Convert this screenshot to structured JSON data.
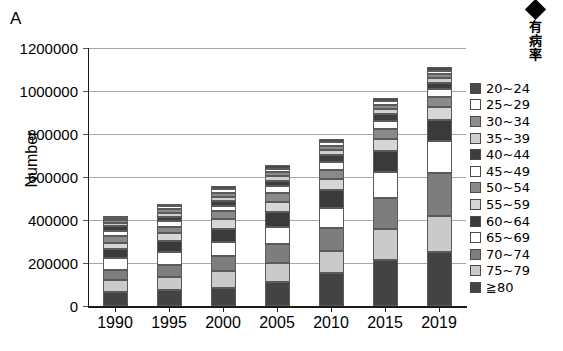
{
  "panel": {
    "letter": "A"
  },
  "prevalence_marker": {
    "icon": "black-diamond-marker",
    "label_chars": [
      "有",
      "病",
      "率"
    ],
    "label": "有病率"
  },
  "axes": {
    "ylabel": "Number",
    "xlabel": "",
    "ytick_labels": [
      "0",
      "200000",
      "400000",
      "600000",
      "800000",
      "1000000",
      "1200000"
    ],
    "ytick_values": [
      0,
      200000,
      400000,
      600000,
      800000,
      1000000,
      1200000
    ],
    "ylim": [
      0,
      1200000
    ],
    "grid": "horizontal",
    "grid_color": "#a8a8a8"
  },
  "legend": {
    "position": "right",
    "items": [
      {
        "label": "20~24",
        "color": "#4a4a4a"
      },
      {
        "label": "25~29",
        "color": "#ffffff"
      },
      {
        "label": "30~34",
        "color": "#8c8c8c"
      },
      {
        "label": "35~39",
        "color": "#cfcfcf"
      },
      {
        "label": "40~44",
        "color": "#3d3d3d"
      },
      {
        "label": "45~49",
        "color": "#fdfdfd"
      },
      {
        "label": "50~54",
        "color": "#8a8a8a"
      },
      {
        "label": "55~59",
        "color": "#d6d6d6"
      },
      {
        "label": "60~64",
        "color": "#3a3a3a"
      },
      {
        "label": "65~69",
        "color": "#ffffff"
      },
      {
        "label": "70~74",
        "color": "#7d7d7d"
      },
      {
        "label": "75~79",
        "color": "#cacaca"
      },
      {
        "label": "≧80",
        "color": "#434343"
      }
    ]
  },
  "chart_data": {
    "type": "bar",
    "subtype": "stacked-vertical",
    "title": "",
    "xlabel": "",
    "ylabel": "Number",
    "ylim": [
      0,
      1200000
    ],
    "categories": [
      "1990",
      "1995",
      "2000",
      "2005",
      "2010",
      "2015",
      "2019"
    ],
    "stack_order_bottom_to_top": [
      "≧80",
      "75~79",
      "70~74",
      "65~69",
      "60~64",
      "55~59",
      "50~54",
      "45~49",
      "40~44",
      "35~39",
      "30~34",
      "25~29",
      "20~24"
    ],
    "series": [
      {
        "name": "≧80",
        "color": "#434343",
        "values": [
          63000,
          74000,
          84000,
          110000,
          152000,
          215000,
          253000
        ]
      },
      {
        "name": "75~79",
        "color": "#cacaca",
        "values": [
          56000,
          62000,
          78000,
          92000,
          104000,
          145000,
          168000
        ]
      },
      {
        "name": "70~74",
        "color": "#7d7d7d",
        "values": [
          47000,
          55000,
          73000,
          85000,
          106000,
          143000,
          198000
        ]
      },
      {
        "name": "65~69",
        "color": "#ffffff",
        "values": [
          56000,
          59000,
          65000,
          82000,
          94000,
          120000,
          149000
        ]
      },
      {
        "name": "60~64",
        "color": "#3a3a3a",
        "values": [
          44000,
          54000,
          60000,
          68000,
          84000,
          99000,
          96000
        ]
      },
      {
        "name": "55~59",
        "color": "#d6d6d6",
        "values": [
          29000,
          35000,
          44000,
          47000,
          50000,
          56000,
          61000
        ]
      },
      {
        "name": "50~54",
        "color": "#8a8a8a",
        "values": [
          31000,
          29000,
          36000,
          42000,
          44000,
          45000,
          48000
        ]
      },
      {
        "name": "45~49",
        "color": "#fdfdfd",
        "values": [
          25000,
          26000,
          26000,
          32000,
          38000,
          37000,
          38000
        ]
      },
      {
        "name": "40~44",
        "color": "#3d3d3d",
        "values": [
          22000,
          22000,
          24000,
          26000,
          31000,
          32000,
          27000
        ]
      },
      {
        "name": "35~39",
        "color": "#cfcfcf",
        "values": [
          15000,
          18000,
          19000,
          21000,
          22000,
          25000,
          22000
        ]
      },
      {
        "name": "30~34",
        "color": "#8c8c8c",
        "values": [
          14000,
          16000,
          18000,
          18000,
          20000,
          20000,
          19000
        ]
      },
      {
        "name": "25~29",
        "color": "#ffffff",
        "values": [
          10000,
          14000,
          16000,
          17000,
          17000,
          16000,
          16000
        ]
      },
      {
        "name": "20~24",
        "color": "#4a4a4a",
        "values": [
          8000,
          12000,
          14000,
          15000,
          16000,
          15000,
          15000
        ]
      }
    ],
    "totals": [
      420000,
      476000,
      557000,
      655000,
      778000,
      968000,
      1110000
    ]
  }
}
